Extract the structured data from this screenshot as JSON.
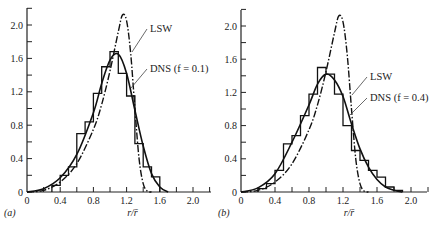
{
  "chart_data": [
    {
      "type": "bar",
      "panel_label": "(a)",
      "title": "",
      "xlabel": "r/r̄",
      "ylabel": "",
      "xlim": [
        0,
        2.2
      ],
      "ylim": [
        0,
        2.2
      ],
      "xticks": [
        "0",
        "0.4",
        "0.8",
        "1.2",
        "1.6",
        "2.0"
      ],
      "yticks": [
        "0",
        "0.4",
        "0.8",
        "1.2",
        "1.6",
        "2.0"
      ],
      "grid": false,
      "histogram": {
        "name": "DNS (f = 0.1)",
        "bin_edges": [
          0.3,
          0.4,
          0.5,
          0.6,
          0.7,
          0.8,
          0.9,
          1.0,
          1.1,
          1.2,
          1.3,
          1.4,
          1.5,
          1.6
        ],
        "values": [
          0.08,
          0.2,
          0.3,
          0.7,
          0.84,
          1.18,
          1.5,
          1.68,
          1.42,
          1.15,
          0.58,
          0.3,
          0.18
        ]
      },
      "series": [
        {
          "name": "LSW",
          "style": "dash-dot",
          "x": [
            0,
            0.2,
            0.4,
            0.6,
            0.8,
            0.9,
            1.0,
            1.1,
            1.15,
            1.2,
            1.25,
            1.3,
            1.35,
            1.4,
            1.45,
            1.5
          ],
          "values": [
            0,
            0.02,
            0.12,
            0.34,
            0.75,
            1.05,
            1.45,
            1.92,
            2.12,
            2.05,
            1.65,
            1.0,
            0.4,
            0.1,
            0.01,
            0
          ]
        },
        {
          "name": "DNS (f = 0.1) fit",
          "style": "solid",
          "x": [
            0,
            0.2,
            0.4,
            0.6,
            0.8,
            0.9,
            1.0,
            1.1,
            1.2,
            1.3,
            1.4,
            1.5,
            1.6,
            1.7
          ],
          "values": [
            0,
            0.04,
            0.17,
            0.45,
            0.95,
            1.3,
            1.58,
            1.65,
            1.42,
            0.98,
            0.55,
            0.22,
            0.06,
            0
          ]
        }
      ],
      "annotations": [
        "LSW",
        "DNS (f = 0.1)"
      ]
    },
    {
      "type": "bar",
      "panel_label": "(b)",
      "title": "",
      "xlabel": "r/r̄",
      "ylabel": "",
      "xlim": [
        0,
        2.2
      ],
      "ylim": [
        0,
        2.2
      ],
      "xticks": [
        "0",
        "0.4",
        "0.8",
        "1.2",
        "1.6",
        "2.0"
      ],
      "yticks": [
        "0",
        "0.4",
        "0.8",
        "1.2",
        "1.6",
        "2.0"
      ],
      "grid": false,
      "histogram": {
        "name": "DNS (f = 0.4)",
        "bin_edges": [
          0.2,
          0.3,
          0.4,
          0.5,
          0.6,
          0.7,
          0.8,
          0.9,
          1.0,
          1.1,
          1.2,
          1.3,
          1.4,
          1.5,
          1.6,
          1.7,
          1.8,
          1.9
        ],
        "values": [
          0.04,
          0.1,
          0.26,
          0.58,
          0.68,
          0.92,
          1.18,
          1.5,
          1.42,
          1.18,
          0.8,
          0.5,
          0.38,
          0.26,
          0.18,
          0.06,
          0.02
        ]
      },
      "series": [
        {
          "name": "LSW",
          "style": "dash-dot",
          "x": [
            0,
            0.2,
            0.4,
            0.6,
            0.8,
            0.9,
            1.0,
            1.1,
            1.15,
            1.2,
            1.25,
            1.3,
            1.35,
            1.4,
            1.45,
            1.5
          ],
          "values": [
            0,
            0.02,
            0.12,
            0.34,
            0.75,
            1.05,
            1.45,
            1.92,
            2.12,
            2.05,
            1.65,
            1.0,
            0.4,
            0.1,
            0.01,
            0
          ]
        },
        {
          "name": "DNS (f = 0.4) fit",
          "style": "solid",
          "x": [
            0,
            0.2,
            0.4,
            0.6,
            0.8,
            0.9,
            1.0,
            1.1,
            1.2,
            1.3,
            1.4,
            1.5,
            1.6,
            1.7,
            1.8,
            1.9
          ],
          "values": [
            0,
            0.05,
            0.22,
            0.6,
            1.05,
            1.3,
            1.42,
            1.35,
            1.15,
            0.82,
            0.52,
            0.3,
            0.15,
            0.06,
            0.02,
            0
          ]
        }
      ],
      "annotations": [
        "LSW",
        "DNS (f = 0.4)"
      ]
    }
  ],
  "panels": [
    {
      "label": "(a)",
      "xlabel": "r/r̄",
      "anno_lsw": "LSW",
      "anno_dns": "DNS (f = 0.1)"
    },
    {
      "label": "(b)",
      "xlabel": "r/r̄",
      "anno_lsw": "LSW",
      "anno_dns": "DNS (f = 0.4)"
    }
  ]
}
